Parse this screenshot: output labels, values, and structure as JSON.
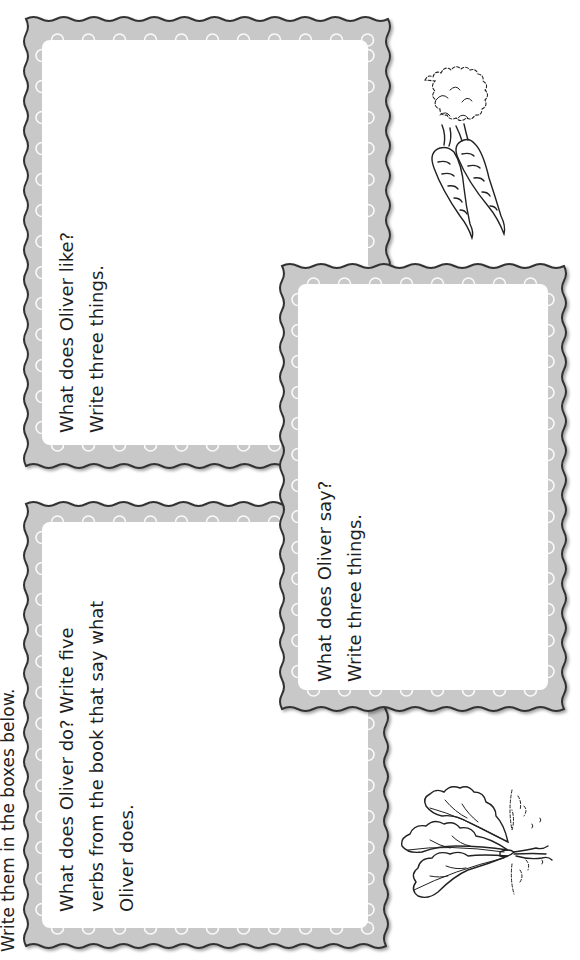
{
  "instruction": {
    "text": "Write them in the boxes below."
  },
  "cards": [
    {
      "id": "like",
      "lines": [
        "What does Oliver like?",
        "Write three things."
      ]
    },
    {
      "id": "do",
      "lines": [
        "What does Oliver do? Write five",
        "verbs from the book that say what",
        "Oliver does."
      ]
    },
    {
      "id": "say",
      "lines": [
        "What does Oliver say?",
        "Write three things."
      ]
    }
  ],
  "illustrations": [
    {
      "name": "carrots",
      "icon": "carrot-icon"
    },
    {
      "name": "beet",
      "icon": "beet-icon"
    }
  ],
  "colors": {
    "frame_fill": "#c8c8c8",
    "frame_stroke": "#333333",
    "inner": "#ffffff",
    "scallop": "#f2f2f2"
  }
}
